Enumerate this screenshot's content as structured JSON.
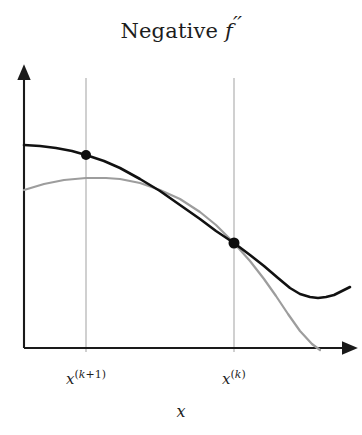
{
  "figure": {
    "title_prefix": "Negative ",
    "title_symbol": "f",
    "title_primes": "′′",
    "title_full": "Negative f′′",
    "background_color": "#ffffff"
  },
  "axes": {
    "x_axis_label": "x",
    "y_axis_label": "",
    "x_axis_arrow": true,
    "y_axis_arrow": true,
    "axis_color": "#1a1a1a",
    "origin_px": [
      24,
      348
    ],
    "x_axis_end_px": [
      350,
      348
    ],
    "y_axis_top_px": [
      24,
      72
    ]
  },
  "tick_labels": [
    {
      "name": "x-k-plus-1",
      "var": "x",
      "sup_open": "(",
      "sup_index": "k",
      "sup_rest": "+1",
      "sup_close": ")",
      "full": "x(k+1)",
      "x_px": 86
    },
    {
      "name": "x-k",
      "var": "x",
      "sup_open": "(",
      "sup_index": "k",
      "sup_rest": "",
      "sup_close": ")",
      "full": "x(k)",
      "x_px": 234
    }
  ],
  "gridlines": {
    "color": "#a9a9a9",
    "width": 1,
    "x_positions_px": [
      86,
      234
    ],
    "top_px": 78,
    "bottom_px": 352
  },
  "markers": [
    {
      "name": "point-x-k-plus-1",
      "x_px": 86,
      "y_px": 155,
      "radius": 5,
      "color": "#0d0d0d"
    },
    {
      "name": "point-x-k",
      "x_px": 234,
      "y_px": 243,
      "radius": 5.5,
      "color": "#0d0d0d"
    }
  ],
  "chart_data": {
    "type": "line",
    "title": "Negative f′′",
    "xlabel": "x",
    "ylabel": "",
    "grid": true,
    "legend": null,
    "xlim": [
      0,
      1
    ],
    "ylim": [
      0,
      1
    ],
    "annotations": [
      {
        "text": "x(k)",
        "kind": "x-tick",
        "x": 0.644
      },
      {
        "text": "x(k+1)",
        "kind": "x-tick",
        "x": 0.19
      }
    ],
    "series": [
      {
        "name": "objective-function",
        "label": "f",
        "color": "#111111",
        "width": 2.6,
        "points_px": [
          [
            24,
            145
          ],
          [
            40,
            146
          ],
          [
            56,
            148
          ],
          [
            72,
            151
          ],
          [
            86,
            155
          ],
          [
            104,
            161
          ],
          [
            120,
            168
          ],
          [
            140,
            179
          ],
          [
            160,
            191
          ],
          [
            180,
            205
          ],
          [
            200,
            219
          ],
          [
            216,
            231
          ],
          [
            234,
            243
          ],
          [
            250,
            255
          ],
          [
            264,
            266
          ],
          [
            278,
            278
          ],
          [
            290,
            288
          ],
          [
            300,
            294
          ],
          [
            310,
            297
          ],
          [
            318,
            298
          ],
          [
            326,
            297
          ],
          [
            334,
            295
          ],
          [
            342,
            291
          ],
          [
            350,
            287
          ]
        ]
      },
      {
        "name": "quadratic-approximation",
        "label": "quadratic model",
        "color": "#9d9d9d",
        "width": 2.2,
        "points_px": [
          [
            24,
            190
          ],
          [
            44,
            184
          ],
          [
            64,
            180
          ],
          [
            86,
            178
          ],
          [
            106,
            178
          ],
          [
            120,
            179
          ],
          [
            140,
            183
          ],
          [
            160,
            190
          ],
          [
            180,
            199
          ],
          [
            200,
            212
          ],
          [
            216,
            225
          ],
          [
            234,
            243
          ],
          [
            250,
            261
          ],
          [
            264,
            279
          ],
          [
            276,
            296
          ],
          [
            288,
            314
          ],
          [
            300,
            331
          ],
          [
            312,
            344
          ],
          [
            320,
            350
          ]
        ]
      }
    ]
  }
}
